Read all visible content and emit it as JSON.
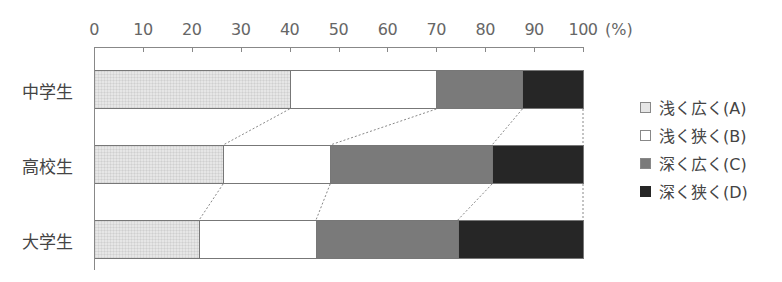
{
  "chart_data": {
    "type": "bar",
    "orientation": "horizontal",
    "stacked": true,
    "percent": true,
    "title": "",
    "xlabel": "(%)",
    "ylabel": "",
    "xlim": [
      0,
      100
    ],
    "x_ticks": [
      "0",
      "10",
      "20",
      "30",
      "40",
      "50",
      "60",
      "70",
      "80",
      "90",
      "100"
    ],
    "unit": "(%)",
    "categories": [
      "中学生",
      "高校生",
      "大学生"
    ],
    "series": [
      {
        "name": "浅く広く(A)",
        "key": "A",
        "color": "#e6e6e6",
        "values": [
          40.0,
          26.4,
          21.5
        ]
      },
      {
        "name": "浅く狭く(B)",
        "key": "B",
        "color": "#ffffff",
        "values": [
          30.0,
          21.9,
          23.9
        ]
      },
      {
        "name": "深く広く(C)",
        "key": "C",
        "color": "#7a7a7a",
        "values": [
          17.6,
          33.1,
          29.0
        ]
      },
      {
        "name": "深く狭く(D)",
        "key": "D",
        "color": "#262626",
        "values": [
          12.4,
          18.6,
          25.6
        ]
      }
    ],
    "legend_position": "right",
    "grid": false,
    "connector_lines": "dotted lines link segment boundaries between adjacent bars"
  },
  "axis": {
    "ticks": [
      "0",
      "10",
      "20",
      "30",
      "40",
      "50",
      "60",
      "70",
      "80",
      "90",
      "100"
    ],
    "unit": "(%)"
  },
  "categories": [
    "中学生",
    "高校生",
    "大学生"
  ],
  "legend": [
    {
      "label": "浅く広く(A)",
      "key": "A"
    },
    {
      "label": "浅く狭く(B)",
      "key": "B"
    },
    {
      "label": "深く広く(C)",
      "key": "C"
    },
    {
      "label": "深く狭く(D)",
      "key": "D"
    }
  ]
}
